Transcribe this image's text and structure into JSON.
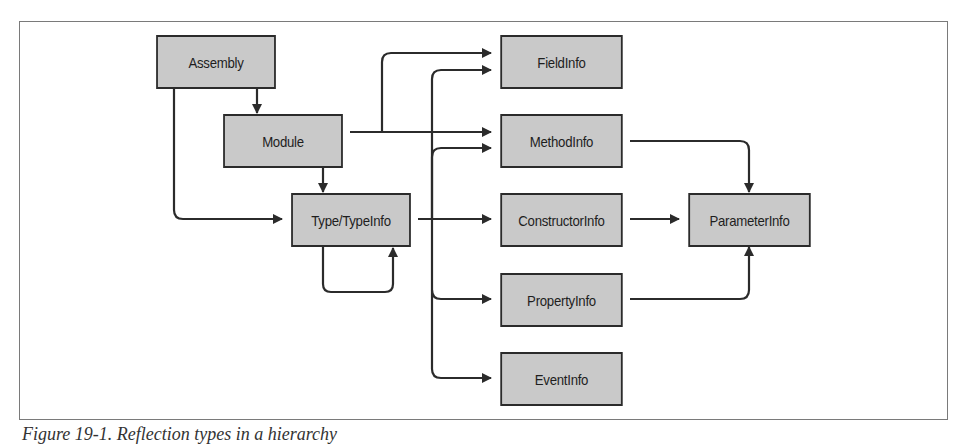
{
  "diagram": {
    "nodes": {
      "assembly": "Assembly",
      "module": "Module",
      "type": "Type/TypeInfo",
      "field": "FieldInfo",
      "method": "MethodInfo",
      "constructor": "ConstructorInfo",
      "property": "PropertyInfo",
      "event": "EventInfo",
      "parameter": "ParameterInfo"
    },
    "edges": [
      {
        "from": "Assembly",
        "to": "Module"
      },
      {
        "from": "Assembly",
        "to": "Type/TypeInfo"
      },
      {
        "from": "Module",
        "to": "Type/TypeInfo"
      },
      {
        "from": "Module",
        "to": "FieldInfo"
      },
      {
        "from": "Module",
        "to": "MethodInfo"
      },
      {
        "from": "Type/TypeInfo",
        "to": "Type/TypeInfo"
      },
      {
        "from": "Type/TypeInfo",
        "to": "FieldInfo"
      },
      {
        "from": "Type/TypeInfo",
        "to": "MethodInfo"
      },
      {
        "from": "Type/TypeInfo",
        "to": "ConstructorInfo"
      },
      {
        "from": "Type/TypeInfo",
        "to": "PropertyInfo"
      },
      {
        "from": "Type/TypeInfo",
        "to": "EventInfo"
      },
      {
        "from": "MethodInfo",
        "to": "ParameterInfo"
      },
      {
        "from": "ConstructorInfo",
        "to": "ParameterInfo"
      },
      {
        "from": "PropertyInfo",
        "to": "ParameterInfo"
      }
    ],
    "colors": {
      "node_fill": "#c9c9c9",
      "node_border": "#2b2b2b",
      "edge": "#2b2b2b",
      "frame": "#7a7a7a"
    }
  },
  "caption": "Figure 19-1. Reflection types in a hierarchy"
}
